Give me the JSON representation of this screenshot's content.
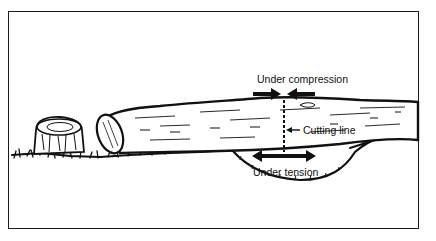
{
  "figure": {
    "labels": {
      "compression": "Under compression",
      "cutting_line": "Cutting line",
      "tension": "Under tension"
    },
    "elements": [
      "tree-stump",
      "fallen-log",
      "ground-depression",
      "compression-arrows",
      "tension-arrow",
      "cutting-line"
    ],
    "colors": {
      "ink": "#111111",
      "background": "#ffffff"
    }
  }
}
